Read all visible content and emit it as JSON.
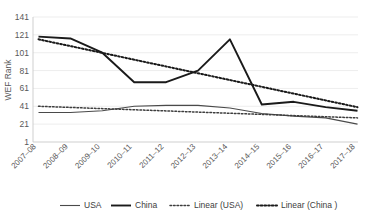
{
  "chart_data": {
    "type": "line",
    "title": "",
    "xlabel": "",
    "ylabel": "WEF Rank",
    "ylim": [
      1,
      141
    ],
    "ytick_values": [
      1,
      21,
      41,
      61,
      81,
      101,
      121,
      141
    ],
    "ytick_labels": [
      "1",
      "21",
      "41",
      "61",
      "81",
      "101",
      "121",
      "141"
    ],
    "grid": true,
    "legend_position": "bottom",
    "categories": [
      "2007–08",
      "2008–09",
      "2009–10",
      "2010–11",
      "2011–12",
      "2012–13",
      "2013–14",
      "2014–15",
      "2015–16",
      "2016–17",
      "2017–18"
    ],
    "series": [
      {
        "name": "USA",
        "style": "solid-thin",
        "values": [
          34,
          34,
          36,
          41,
          42,
          42,
          39,
          33,
          30,
          28,
          21
        ]
      },
      {
        "name": "China",
        "style": "solid-thick",
        "values": [
          119,
          117,
          101,
          68,
          68,
          81,
          116,
          43,
          46,
          40,
          36
        ]
      },
      {
        "name": "Linear (USA)",
        "style": "dotted",
        "trendline": true,
        "endpoints": [
          41,
          28
        ]
      },
      {
        "name": "Linear (China )",
        "style": "dotted",
        "trendline": true,
        "endpoints": [
          116,
          40
        ]
      }
    ]
  },
  "legend": {
    "items": [
      {
        "label": "USA",
        "swatch": "solid-thin-line"
      },
      {
        "label": "China",
        "swatch": "solid-thick-line"
      },
      {
        "label": "Linear (USA)",
        "swatch": "dotted-line"
      },
      {
        "label": "Linear (China )",
        "swatch": "dotted-thick-line"
      }
    ]
  },
  "axes": {
    "y_title": "WEF Rank"
  }
}
